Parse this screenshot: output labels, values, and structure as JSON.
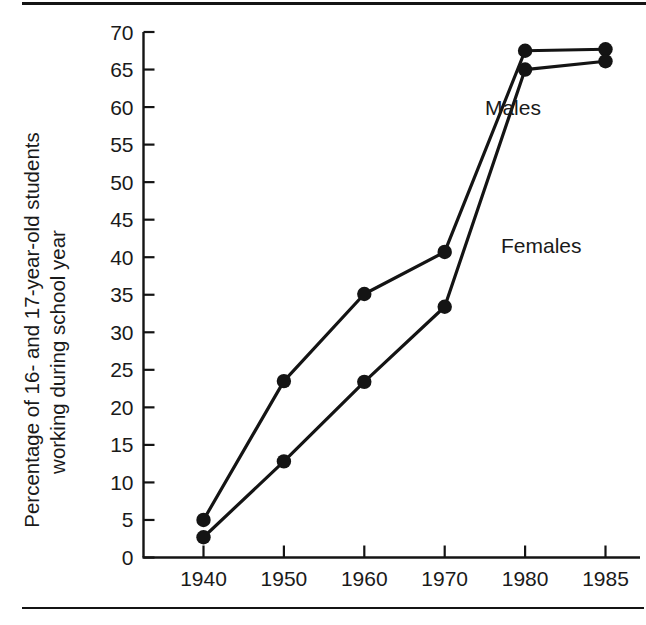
{
  "figure": {
    "background_color": "#ffffff",
    "ink_color": "#141414",
    "top_rule": true,
    "bottom_rule": true
  },
  "chart_data": {
    "type": "line",
    "title": "",
    "xlabel": "",
    "ylabel": "Percentage of 16- and 17-year-old students working during school year",
    "ylabel_line1": "Percentage of 16- and 17-year-old students",
    "ylabel_line2": "working during school year",
    "categories": [
      "1940",
      "1950",
      "1960",
      "1970",
      "1980",
      "1985"
    ],
    "x": [
      1940,
      1950,
      1960,
      1970,
      1980,
      1985
    ],
    "x_spacing": "categorical-even",
    "ylim": [
      0,
      70
    ],
    "yticks": [
      0,
      5,
      10,
      15,
      20,
      25,
      30,
      35,
      40,
      45,
      50,
      55,
      60,
      65,
      70
    ],
    "ytick_labels": [
      "0",
      "5",
      "10",
      "15",
      "20",
      "25",
      "30",
      "35",
      "40",
      "45",
      "50",
      "55",
      "60",
      "65",
      "70"
    ],
    "grid": false,
    "legend": "inline-annotations",
    "marker": "filled-circle",
    "series": [
      {
        "name": "Males",
        "label": "Males",
        "values": [
          5.0,
          23.5,
          35.1,
          40.7,
          67.5,
          67.7
        ],
        "color": "#141414"
      },
      {
        "name": "Females",
        "label": "Females",
        "values": [
          2.7,
          12.8,
          23.4,
          33.4,
          65.0,
          66.1
        ],
        "color": "#141414"
      }
    ],
    "annotations": [
      {
        "text": "Males",
        "x": 1975,
        "y": 59.0
      },
      {
        "text": "Females",
        "x": 1977,
        "y": 40.5
      }
    ]
  }
}
